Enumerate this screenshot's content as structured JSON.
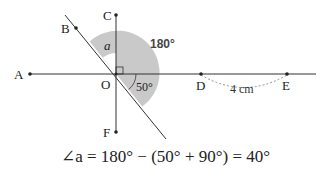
{
  "diagram": {
    "points": {
      "A": {
        "label": "A",
        "x": 30,
        "y": 74
      },
      "B": {
        "label": "B",
        "x": 76,
        "y": 28
      },
      "C": {
        "label": "C",
        "x": 116,
        "y": 15
      },
      "D": {
        "label": "D",
        "x": 201,
        "y": 74
      },
      "E": {
        "label": "E",
        "x": 287,
        "y": 74
      },
      "F": {
        "label": "F",
        "x": 116,
        "y": 132
      },
      "O": {
        "label": "O",
        "x": 116,
        "y": 74
      }
    },
    "labels": {
      "angle_a": "a",
      "angle_180": "180°",
      "angle_50": "50°",
      "distance_DE": "4 cm"
    },
    "colors": {
      "shade": "#c9c9c9",
      "line": "#333333",
      "dashed": "#777777"
    }
  },
  "formula": {
    "text": "∠a = 180° − (50° + 90°) = 40°"
  }
}
